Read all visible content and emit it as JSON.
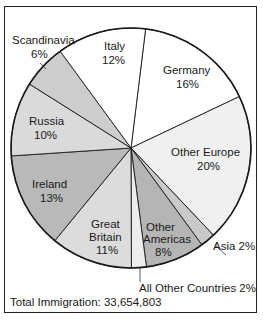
{
  "chart_data": {
    "type": "pie",
    "title": "",
    "start_angle_deg": 7,
    "direction": "clockwise",
    "slices": [
      {
        "label": "Germany",
        "value": 16,
        "color": "#ffffff"
      },
      {
        "label": "Other Europe",
        "value": 20,
        "color": "#f0f0f0"
      },
      {
        "label": "Asia",
        "value": 2,
        "color": "#c9c9c9"
      },
      {
        "label": "Other Americas",
        "value": 8,
        "color": "#b5b5b5"
      },
      {
        "label": "All Other Countries",
        "value": 2,
        "color": "#ededed"
      },
      {
        "label": "Great Britain",
        "value": 11,
        "color": "#dcdcdc"
      },
      {
        "label": "Ireland",
        "value": 13,
        "color": "#b9b9b9"
      },
      {
        "label": "Russia",
        "value": 10,
        "color": "#dadada"
      },
      {
        "label": "Scandinavia",
        "value": 6,
        "color": "#cdcdcd"
      },
      {
        "label": "Italy",
        "value": 12,
        "color": "#ffffff"
      }
    ],
    "annotations": [
      {
        "label": "Scandinavia",
        "pct": "6%"
      },
      {
        "label": "Italy",
        "pct": "12%"
      },
      {
        "label": "Germany",
        "pct": "16%"
      },
      {
        "label": "Russia",
        "pct": "10%"
      },
      {
        "label": "Other Europe",
        "pct": "20%"
      },
      {
        "label": "Ireland",
        "pct": "13%"
      },
      {
        "label": "Great Britain",
        "pct": "11%"
      },
      {
        "label": "Other Americas",
        "pct": "8%"
      },
      {
        "label": "Asia 2%"
      },
      {
        "label": "All Other Countries 2%"
      }
    ],
    "footer": "Total Immigration: 33,654,803",
    "unit": "percent"
  },
  "labels": {
    "scandinavia_name": "Scandinavia",
    "scandinavia_pct": "6%",
    "italy_name": "Italy",
    "italy_pct": "12%",
    "germany_name": "Germany",
    "germany_pct": "16%",
    "russia_name": "Russia",
    "russia_pct": "10%",
    "other_europe_name": "Other Europe",
    "other_europe_pct": "20%",
    "ireland_name": "Ireland",
    "ireland_pct": "13%",
    "gb_line1": "Great",
    "gb_line2": "Britain",
    "gb_pct": "11%",
    "oa_line1": "Other",
    "oa_line2": "Americas",
    "oa_pct": "8%",
    "asia": "Asia 2%",
    "all_other": "All Other Countries 2%"
  },
  "footer": {
    "total": "Total Immigration: 33,654,803"
  }
}
